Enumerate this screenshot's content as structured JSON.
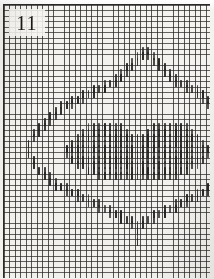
{
  "document": {
    "kind": "needlework-pattern-chart",
    "chart_number": "11",
    "caption": "Chart 11"
  },
  "colors": {
    "paper": "#f1f0ed",
    "grid_line": "#282826",
    "stitch": "#262523",
    "frame": "#2a2a28",
    "number_text": "#181816"
  },
  "grid": {
    "cell_px": 5.45,
    "columns": 38,
    "rows": 50,
    "origin_x": 4,
    "origin_y": 5,
    "visible": true
  },
  "chart_data": {
    "type": "heatmap",
    "title": "11",
    "xlabel": "",
    "ylabel": "",
    "legend": [],
    "columns": 38,
    "rows": 50,
    "symbol": "vertical-stitch",
    "cells": [
      [
        25,
        8
      ],
      [
        26,
        8
      ],
      [
        24,
        9
      ],
      [
        25,
        9
      ],
      [
        26,
        9
      ],
      [
        27,
        9
      ],
      [
        23,
        10
      ],
      [
        24,
        10
      ],
      [
        27,
        10
      ],
      [
        28,
        10
      ],
      [
        22,
        11
      ],
      [
        23,
        11
      ],
      [
        28,
        11
      ],
      [
        29,
        11
      ],
      [
        21,
        12
      ],
      [
        22,
        12
      ],
      [
        29,
        12
      ],
      [
        30,
        12
      ],
      [
        20,
        13
      ],
      [
        21,
        13
      ],
      [
        30,
        13
      ],
      [
        31,
        13
      ],
      [
        18,
        14
      ],
      [
        19,
        14
      ],
      [
        20,
        14
      ],
      [
        31,
        14
      ],
      [
        32,
        14
      ],
      [
        33,
        14
      ],
      [
        16,
        15
      ],
      [
        17,
        15
      ],
      [
        18,
        15
      ],
      [
        33,
        15
      ],
      [
        34,
        15
      ],
      [
        35,
        15
      ],
      [
        14,
        16
      ],
      [
        15,
        16
      ],
      [
        16,
        16
      ],
      [
        35,
        16
      ],
      [
        36,
        16
      ],
      [
        12,
        17
      ],
      [
        13,
        17
      ],
      [
        14,
        17
      ],
      [
        36,
        17
      ],
      [
        37,
        17
      ],
      [
        10,
        18
      ],
      [
        11,
        18
      ],
      [
        12,
        18
      ],
      [
        37,
        18
      ],
      [
        38,
        18
      ],
      [
        9,
        19
      ],
      [
        10,
        19
      ],
      [
        38,
        19
      ],
      [
        39,
        19
      ],
      [
        8,
        20
      ],
      [
        9,
        20
      ],
      [
        39,
        20
      ],
      [
        40,
        20
      ],
      [
        7,
        21
      ],
      [
        8,
        21
      ],
      [
        40,
        21
      ],
      [
        41,
        21
      ],
      [
        6,
        22
      ],
      [
        7,
        22
      ],
      [
        41,
        22
      ],
      [
        42,
        22
      ],
      [
        5,
        23
      ],
      [
        6,
        23
      ],
      [
        42,
        23
      ],
      [
        43,
        23
      ],
      [
        5,
        24
      ],
      [
        43,
        24
      ],
      [
        4,
        25
      ],
      [
        44,
        25
      ],
      [
        4,
        26
      ],
      [
        44,
        26
      ],
      [
        4,
        27
      ],
      [
        44,
        27
      ],
      [
        5,
        28
      ],
      [
        43,
        28
      ],
      [
        5,
        29
      ],
      [
        43,
        29
      ],
      [
        6,
        30
      ],
      [
        7,
        30
      ],
      [
        41,
        30
      ],
      [
        42,
        30
      ],
      [
        7,
        31
      ],
      [
        8,
        31
      ],
      [
        40,
        31
      ],
      [
        41,
        31
      ],
      [
        8,
        32
      ],
      [
        9,
        32
      ],
      [
        39,
        32
      ],
      [
        40,
        32
      ],
      [
        9,
        33
      ],
      [
        10,
        33
      ],
      [
        11,
        33
      ],
      [
        37,
        33
      ],
      [
        38,
        33
      ],
      [
        39,
        33
      ],
      [
        11,
        34
      ],
      [
        12,
        34
      ],
      [
        13,
        34
      ],
      [
        35,
        34
      ],
      [
        36,
        34
      ],
      [
        37,
        34
      ],
      [
        13,
        35
      ],
      [
        14,
        35
      ],
      [
        15,
        35
      ],
      [
        33,
        35
      ],
      [
        34,
        35
      ],
      [
        35,
        35
      ],
      [
        15,
        36
      ],
      [
        16,
        36
      ],
      [
        17,
        36
      ],
      [
        31,
        36
      ],
      [
        32,
        36
      ],
      [
        33,
        36
      ],
      [
        17,
        37
      ],
      [
        18,
        37
      ],
      [
        19,
        37
      ],
      [
        29,
        37
      ],
      [
        30,
        37
      ],
      [
        31,
        37
      ],
      [
        19,
        38
      ],
      [
        20,
        38
      ],
      [
        21,
        38
      ],
      [
        27,
        38
      ],
      [
        28,
        38
      ],
      [
        29,
        38
      ],
      [
        21,
        39
      ],
      [
        22,
        39
      ],
      [
        23,
        39
      ],
      [
        25,
        39
      ],
      [
        26,
        39
      ],
      [
        27,
        39
      ],
      [
        23,
        40
      ],
      [
        24,
        40
      ],
      [
        25,
        40
      ],
      [
        24,
        41
      ],
      [
        24,
        42
      ],
      [
        24,
        43
      ]
    ],
    "fill_region": {
      "description": "solid filled lozenge at chart centre",
      "rows": [
        {
          "row": 22,
          "from": 15,
          "to": 21
        },
        {
          "row": 22,
          "from": 27,
          "to": 33
        },
        {
          "row": 23,
          "from": 14,
          "to": 22
        },
        {
          "row": 23,
          "from": 26,
          "to": 34
        },
        {
          "row": 24,
          "from": 13,
          "to": 35
        },
        {
          "row": 25,
          "from": 12,
          "to": 36
        },
        {
          "row": 26,
          "from": 11,
          "to": 37
        },
        {
          "row": 27,
          "from": 11,
          "to": 37
        },
        {
          "row": 28,
          "from": 12,
          "to": 36
        },
        {
          "row": 29,
          "from": 13,
          "to": 35
        },
        {
          "row": 30,
          "from": 15,
          "to": 33
        },
        {
          "row": 31,
          "from": 17,
          "to": 31
        }
      ]
    }
  }
}
